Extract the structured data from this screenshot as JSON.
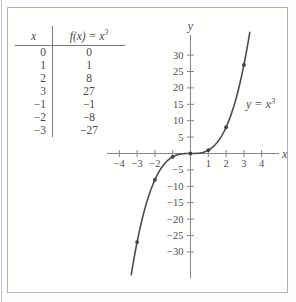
{
  "figure": {
    "table": {
      "header_x": "x",
      "header_fx_base": "f(x) = x",
      "header_fx_sup": "3",
      "rows": [
        {
          "x": "0",
          "fx": "0"
        },
        {
          "x": "1",
          "fx": "1"
        },
        {
          "x": "2",
          "fx": "8"
        },
        {
          "x": "3",
          "fx": "27"
        },
        {
          "x": "−1",
          "fx": "−1"
        },
        {
          "x": "−2",
          "fx": "−8"
        },
        {
          "x": "−3",
          "fx": "−27"
        }
      ]
    }
  },
  "chart_data": {
    "type": "line",
    "title": "",
    "function": "f(x) = x^3",
    "curve_label_base": "y = x",
    "curve_label_sup": "3",
    "x_axis_label": "x",
    "y_axis_label": "y",
    "xlim": [
      -4.7,
      5.0
    ],
    "ylim": [
      -37,
      37
    ],
    "grid": false,
    "x_ticks": [
      {
        "v": -4,
        "label": "−4"
      },
      {
        "v": -3,
        "label": "−3"
      },
      {
        "v": -2,
        "label": "−2"
      },
      {
        "v": -1,
        "label": ""
      },
      {
        "v": 1,
        "label": "1"
      },
      {
        "v": 2,
        "label": "2"
      },
      {
        "v": 3,
        "label": "3"
      },
      {
        "v": 4,
        "label": "4"
      }
    ],
    "y_ticks": [
      {
        "v": 30,
        "label": "30"
      },
      {
        "v": 25,
        "label": "25"
      },
      {
        "v": 20,
        "label": "20"
      },
      {
        "v": 15,
        "label": "15"
      },
      {
        "v": 10,
        "label": "10"
      },
      {
        "v": 5,
        "label": "5"
      },
      {
        "v": -5,
        "label": "−5"
      },
      {
        "v": -10,
        "label": "−10"
      },
      {
        "v": -15,
        "label": "−15"
      },
      {
        "v": -20,
        "label": "−20"
      },
      {
        "v": -25,
        "label": "−25"
      },
      {
        "v": -30,
        "label": "−30"
      }
    ],
    "points": [
      [
        -3,
        -27
      ],
      [
        -2,
        -8
      ],
      [
        -1,
        -1
      ],
      [
        0,
        0
      ],
      [
        1,
        1
      ],
      [
        2,
        8
      ],
      [
        3,
        27
      ]
    ],
    "curve_x_range": [
      -3.33,
      3.33
    ],
    "colors": {
      "curve": "#4d4d4d",
      "axis": "#858585",
      "text": "#4f4f4f",
      "frame": "#b2b2b2"
    }
  }
}
